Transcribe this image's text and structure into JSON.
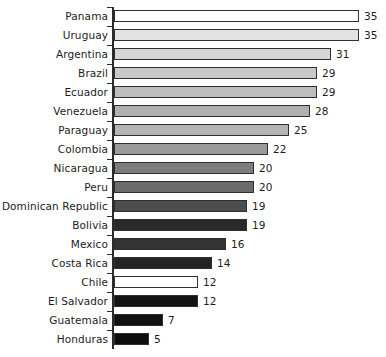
{
  "chart_data": {
    "type": "bar",
    "orientation": "horizontal",
    "title": "",
    "subtitle": "",
    "xlabel": "",
    "ylabel": "",
    "xlim": [
      0,
      35
    ],
    "grid": false,
    "legend": null,
    "axis": {
      "category_axis": "vertical-left",
      "value_axis_visible": false,
      "tick_marks": true
    },
    "categories": [
      "Panama",
      "Uruguay",
      "Argentina",
      "Brazil",
      "Ecuador",
      "Venezuela",
      "Paraguay",
      "Colombia",
      "Nicaragua",
      "Peru",
      "Dominican Republic",
      "Bolivia",
      "Mexico",
      "Costa Rica",
      "Chile",
      "El Salvador",
      "Guatemala",
      "Honduras"
    ],
    "values": [
      35,
      35,
      31,
      29,
      29,
      28,
      25,
      22,
      20,
      20,
      19,
      19,
      16,
      14,
      12,
      12,
      7,
      5
    ],
    "data_labels": [
      "35",
      "35",
      "31",
      "29",
      "29",
      "28",
      "25",
      "22",
      "20",
      "20",
      "19",
      "19",
      "16",
      "14",
      "12",
      "12",
      "7",
      "5"
    ],
    "bar_colors": [
      "#ffffff",
      "#e3e3e3",
      "#d6d6d6",
      "#c9c9c9",
      "#bdbdbd",
      "#b0b0b0",
      "#b4b4b4",
      "#9a9a9a",
      "#7d7d7d",
      "#6b6b6b",
      "#4d4d4d",
      "#2a2a2a",
      "#333333",
      "#242424",
      "#ffffff",
      "#131313",
      "#111111",
      "#0d0d0d"
    ],
    "bar_border_color": "#2f2f2f",
    "text_color": "#1d1d1d",
    "background_color": "#ffffff",
    "px_per_unit": 7.0
  }
}
